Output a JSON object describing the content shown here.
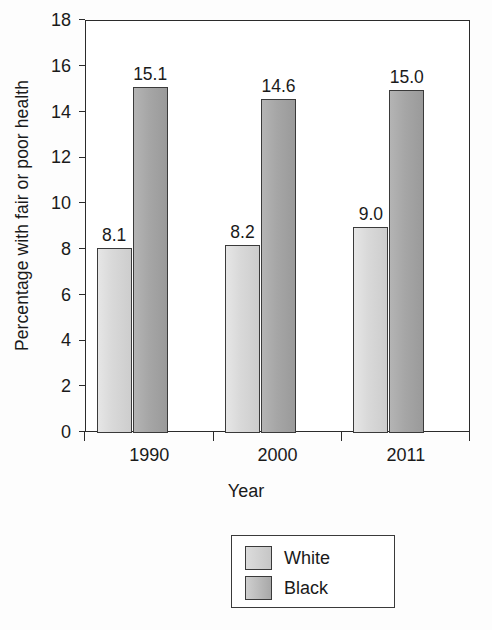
{
  "chart_data": {
    "type": "bar",
    "title": "",
    "xlabel": "Year",
    "ylabel": "Percentage with fair or poor health",
    "categories": [
      "1990",
      "2000",
      "2011"
    ],
    "series": [
      {
        "name": "White",
        "values": [
          8.1,
          8.2,
          9.0
        ],
        "labels": [
          "8.1",
          "8.2",
          "9.0"
        ],
        "color": "#d9d9d9"
      },
      {
        "name": "Black",
        "values": [
          15.1,
          14.6,
          15.0
        ],
        "labels": [
          "15.1",
          "14.6",
          "15.0"
        ],
        "color": "#a6a6a6"
      }
    ],
    "ylim": [
      0,
      18
    ],
    "ytick_labels": [
      "0",
      "2",
      "4",
      "6",
      "8",
      "10",
      "12",
      "14",
      "16",
      "18"
    ],
    "ytick_values": [
      0,
      2,
      4,
      6,
      8,
      10,
      12,
      14,
      16,
      18
    ],
    "grid": false,
    "legend_position": "bottom-center"
  },
  "legend": {
    "entries": [
      {
        "label": "White"
      },
      {
        "label": "Black"
      }
    ]
  }
}
